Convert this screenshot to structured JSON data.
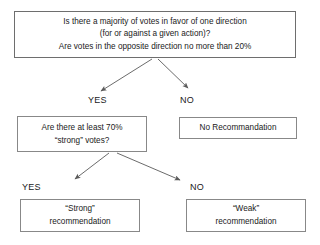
{
  "diagram": {
    "type": "flowchart",
    "nodes": [
      {
        "id": "root",
        "role": "decision",
        "lines": [
          "Is there a majority of votes in favor of one direction",
          "(for or against a given action)?",
          "Are votes in the opposite direction no more than 20%"
        ]
      },
      {
        "id": "strong-votes",
        "role": "decision",
        "lines": [
          "Are there at least 70%",
          "“strong” votes?"
        ]
      },
      {
        "id": "no-recommendation",
        "role": "terminal",
        "lines": [
          "No Recommandation"
        ]
      },
      {
        "id": "strong-recommendation",
        "role": "terminal",
        "lines": [
          "“Strong”",
          "recommendation"
        ]
      },
      {
        "id": "weak-recommendation",
        "role": "terminal",
        "lines": [
          "“Weak”",
          "recommendation"
        ]
      }
    ],
    "edges": [
      {
        "id": "root-yes",
        "from": "root",
        "to": "strong-votes",
        "label": "YES"
      },
      {
        "id": "root-no",
        "from": "root",
        "to": "no-recommendation",
        "label": "NO"
      },
      {
        "id": "votes-yes",
        "from": "strong-votes",
        "to": "strong-recommendation",
        "label": "YES"
      },
      {
        "id": "votes-no",
        "from": "strong-votes",
        "to": "weak-recommendation",
        "label": "NO"
      }
    ],
    "colors": {
      "background": "#ffffff",
      "box_border": "#888888",
      "root_border": "#6e6e6e",
      "text": "#1a1a1a",
      "arrow": "#5a5a5a"
    }
  }
}
